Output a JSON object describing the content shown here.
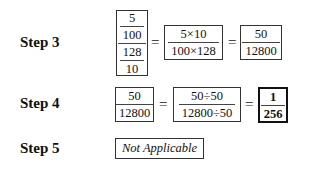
{
  "steps": [
    {
      "label": "Step 3",
      "expression": {
        "complex_fraction": {
          "numerator": {
            "num": "5",
            "den": "100"
          },
          "denominator": {
            "num": "128",
            "den": "10"
          }
        },
        "equals_1": "=",
        "fraction_2": {
          "num": "5×10",
          "den": "100×128"
        },
        "equals_2": "=",
        "fraction_3": {
          "num": "50",
          "den": "12800"
        }
      }
    },
    {
      "label": "Step 4",
      "expression": {
        "fraction_1": {
          "num": "50",
          "den": "12800"
        },
        "equals_1": "=",
        "fraction_2": {
          "num": "50÷50",
          "den": "12800÷50"
        },
        "equals_2": "=",
        "fraction_3": {
          "num": "1",
          "den": "256"
        }
      }
    },
    {
      "label": "Step 5",
      "text": "Not Applicable"
    }
  ]
}
